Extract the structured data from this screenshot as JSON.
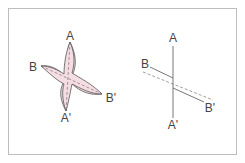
{
  "colors": {
    "frame_border": "#bdbdbd",
    "petal_fill": "#f6dde3",
    "stroke": "#555555",
    "label": "#444444"
  },
  "left_figure": {
    "description": "Four-pointed twisted shape with dashed axes",
    "labels": {
      "top": "A",
      "left": "B",
      "right": "B'",
      "bottom": "A'"
    }
  },
  "right_figure": {
    "description": "Line diagram: vertical axis A–A', solid segments and dashed line B–B'",
    "labels": {
      "top": "A",
      "left": "B",
      "right": "B'",
      "bottom": "A'"
    }
  }
}
